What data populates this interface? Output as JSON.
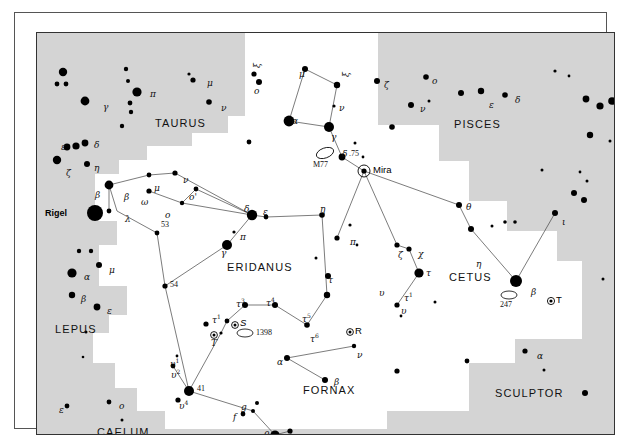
{
  "chart_data": {
    "type": "scatter",
    "xlabel": "",
    "ylabel": "",
    "grid": false,
    "legend": null,
    "constellation_names": [
      {
        "label": "TAURUS",
        "x": 140,
        "y": 90
      },
      {
        "label": "PISCES",
        "x": 450,
        "y": 92
      },
      {
        "label": "ERIDANUS",
        "x": 225,
        "y": 234
      },
      {
        "label": "CETUS",
        "x": 437,
        "y": 244
      },
      {
        "label": "LEPUS",
        "x": 44,
        "y": 296
      },
      {
        "label": "FORNAX",
        "x": 295,
        "y": 357
      },
      {
        "label": "SCULPTOR",
        "x": 497,
        "y": 360
      },
      {
        "label": "CAELUM",
        "x": 92,
        "y": 399
      }
    ],
    "named_objects": [
      {
        "label": "Rigel",
        "x": 30,
        "y": 180,
        "type": "star-name"
      },
      {
        "label": "Mira",
        "x": 341,
        "y": 133,
        "type": "variable-star-name"
      },
      {
        "label": "M77",
        "x": 285,
        "y": 129,
        "type": "deep-sky-object"
      },
      {
        "label": "1398",
        "x": 219,
        "y": 300,
        "type": "deep-sky-object"
      },
      {
        "label": "1291",
        "x": 291,
        "y": 418,
        "type": "deep-sky-object"
      },
      {
        "label": "247",
        "x": 487,
        "y": 270,
        "type": "deep-sky-object"
      },
      {
        "label": "53",
        "x": 124,
        "y": 209,
        "type": "flamsteed-number"
      },
      {
        "label": "54",
        "x": 119,
        "y": 261,
        "type": "flamsteed-number"
      },
      {
        "label": "41",
        "x": 164,
        "y": 358,
        "type": "flamsteed-number"
      },
      {
        "label": ".75",
        "x": 325,
        "y": 121,
        "type": "magnitude-label"
      },
      {
        "label": "S",
        "x": 208,
        "y": 292,
        "type": "variable-star-name"
      },
      {
        "label": "R",
        "x": 321,
        "y": 299,
        "type": "variable-star-name"
      },
      {
        "label": "T",
        "x": 523,
        "y": 268,
        "type": "variable-star-name"
      },
      {
        "label": "T",
        "x": 185,
        "y": 308,
        "type": "variable-star-name"
      }
    ],
    "greek_labels": [
      {
        "label": "γ",
        "x": 66,
        "y": 70
      },
      {
        "label": "π",
        "x": 113,
        "y": 57
      },
      {
        "label": "μ",
        "x": 170,
        "y": 46
      },
      {
        "label": "ν",
        "x": 184,
        "y": 71
      },
      {
        "label": "ε",
        "x": 24,
        "y": 110
      },
      {
        "label": "δ",
        "x": 57,
        "y": 108
      },
      {
        "label": "ζ",
        "x": 29,
        "y": 136
      },
      {
        "label": "η",
        "x": 57,
        "y": 131
      },
      {
        "label": "β",
        "x": 58,
        "y": 158
      },
      {
        "label": "β",
        "x": 87,
        "y": 160
      },
      {
        "label": "λ",
        "x": 88,
        "y": 182
      },
      {
        "label": "ω",
        "x": 104,
        "y": 165
      },
      {
        "label": "μ",
        "x": 117,
        "y": 151
      },
      {
        "label": "ν",
        "x": 146,
        "y": 143
      },
      {
        "label": "ο",
        "x": 128,
        "y": 178
      },
      {
        "label": "ο'",
        "x": 152,
        "y": 160
      },
      {
        "label": "δ",
        "x": 207,
        "y": 172
      },
      {
        "label": "ε",
        "x": 226,
        "y": 175
      },
      {
        "label": "η",
        "x": 283,
        "y": 172
      },
      {
        "label": "π",
        "x": 203,
        "y": 200
      },
      {
        "label": "γ",
        "x": 184,
        "y": 216
      },
      {
        "label": "π",
        "x": 313,
        "y": 205
      },
      {
        "label": "τ",
        "x": 291,
        "y": 243
      },
      {
        "label": "μ",
        "x": 262,
        "y": 37
      },
      {
        "label": "α",
        "x": 255,
        "y": 84
      },
      {
        "label": "ν",
        "x": 302,
        "y": 71
      },
      {
        "label": "γ",
        "x": 294,
        "y": 100
      },
      {
        "label": "δ",
        "x": 305,
        "y": 117
      },
      {
        "label": "ζ",
        "x": 347,
        "y": 48
      },
      {
        "label": "ο",
        "x": 395,
        "y": 44
      },
      {
        "label": "ν",
        "x": 383,
        "y": 72
      },
      {
        "label": "ε",
        "x": 452,
        "y": 68
      },
      {
        "label": "δ",
        "x": 478,
        "y": 63
      },
      {
        "label": "θ",
        "x": 429,
        "y": 170
      },
      {
        "label": "ζ",
        "x": 361,
        "y": 218
      },
      {
        "label": "χ",
        "x": 381,
        "y": 217
      },
      {
        "label": "τ",
        "x": 389,
        "y": 236
      },
      {
        "label": "η",
        "x": 439,
        "y": 227
      },
      {
        "label": "ι",
        "x": 525,
        "y": 185
      },
      {
        "label": "β",
        "x": 494,
        "y": 255
      },
      {
        "label": "υ",
        "x": 364,
        "y": 274
      },
      {
        "label": "υ",
        "x": 342,
        "y": 256
      },
      {
        "label": "α",
        "x": 47,
        "y": 240
      },
      {
        "label": "μ",
        "x": 72,
        "y": 233
      },
      {
        "label": "β",
        "x": 44,
        "y": 262
      },
      {
        "label": "ε",
        "x": 70,
        "y": 274
      },
      {
        "label": "ε",
        "x": 22,
        "y": 373
      },
      {
        "label": "ο",
        "x": 82,
        "y": 369
      },
      {
        "label": "α",
        "x": 500,
        "y": 319
      },
      {
        "label": "α",
        "x": 240,
        "y": 325
      },
      {
        "label": "ν",
        "x": 320,
        "y": 318
      },
      {
        "label": "β",
        "x": 297,
        "y": 345
      },
      {
        "label": "θ",
        "x": 227,
        "y": 398
      },
      {
        "label": "ι",
        "x": 253,
        "y": 403
      }
    ],
    "superscript_labels": [
      {
        "base": "τ",
        "sup": "1",
        "x": 175,
        "y": 281
      },
      {
        "base": "τ",
        "sup": "3",
        "x": 199,
        "y": 265
      },
      {
        "base": "τ",
        "sup": "4",
        "x": 229,
        "y": 264
      },
      {
        "base": "τ",
        "sup": "5",
        "x": 265,
        "y": 280
      },
      {
        "base": "τ",
        "sup": "6",
        "x": 273,
        "y": 300
      },
      {
        "base": "υ",
        "sup": "1",
        "x": 133,
        "y": 325
      },
      {
        "base": "υ",
        "sup": "2",
        "x": 134,
        "y": 336
      },
      {
        "base": "υ",
        "sup": "4",
        "x": 142,
        "y": 367
      },
      {
        "base": "τ",
        "sup": "1",
        "x": 367,
        "y": 259
      }
    ],
    "letter_labels": [
      {
        "label": "f",
        "x": 196,
        "y": 380
      },
      {
        "label": "g",
        "x": 204,
        "y": 370
      },
      {
        "label": "ξ",
        "x": 216,
        "y": 35,
        "rotated": true
      },
      {
        "label": "ο",
        "x": 217,
        "y": 54
      },
      {
        "label": "ξ",
        "x": 305,
        "y": 44,
        "rotated": true
      }
    ]
  },
  "frame": {
    "border_color": "#333333",
    "sky_white": "#ffffff",
    "sky_grey": "#d4d4d4"
  }
}
